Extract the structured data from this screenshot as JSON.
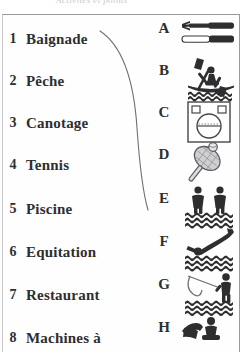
{
  "header": {
    "title": "Activités et points"
  },
  "exercise": {
    "left_column_heading": "",
    "right_column_heading": "",
    "items": [
      {
        "number": "1",
        "label": "Baignade"
      },
      {
        "number": "2",
        "label": "Pêche"
      },
      {
        "number": "3",
        "label": "Canotage"
      },
      {
        "number": "4",
        "label": "Tennis"
      },
      {
        "number": "5",
        "label": "Piscine"
      },
      {
        "number": "6",
        "label": "Equitation"
      },
      {
        "number": "7",
        "label": "Restaurant"
      },
      {
        "number": "8",
        "label": "Machines à"
      }
    ],
    "pictograms": [
      {
        "letter": "A",
        "icon": "fork-and-knife-icon"
      },
      {
        "letter": "B",
        "icon": "kayak-paddler-icon"
      },
      {
        "letter": "C",
        "icon": "washing-machine-icon"
      },
      {
        "letter": "D",
        "icon": "tennis-racket-and-ball-icon"
      },
      {
        "letter": "E",
        "icon": "two-bathers-in-water-icon"
      },
      {
        "letter": "F",
        "icon": "diver-into-pool-icon"
      },
      {
        "letter": "G",
        "icon": "angler-fishing-icon"
      },
      {
        "letter": "H",
        "icon": "horse-rider-icon"
      }
    ],
    "connections": [
      {
        "from": "1",
        "to": "E"
      }
    ]
  },
  "colors": {
    "ink": "#2e2e30",
    "pencil_line": "#6f6f74",
    "frame": "#9a9a9e",
    "paper": "#ffffff"
  }
}
